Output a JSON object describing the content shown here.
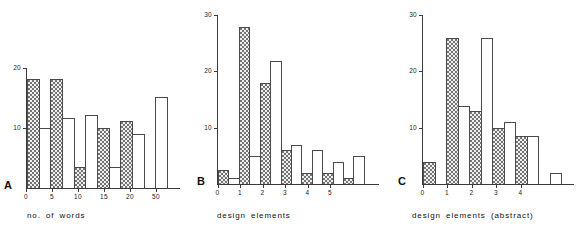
{
  "figure": {
    "background": "#ffffff",
    "bar_fill_color": "#efefef",
    "bar_stroke_color": "#4a4a4a",
    "axis_color": "#3b3b3b"
  },
  "panels": [
    {
      "letter": "A",
      "caption": "no. of words",
      "yticks": [
        "20",
        "10"
      ],
      "xticks": [
        "0",
        "5",
        "10",
        "15",
        "20",
        "50"
      ]
    },
    {
      "letter": "B",
      "caption": "design elements",
      "yticks": [
        "30",
        "20",
        "10"
      ],
      "xticks": [
        "0",
        "1",
        "2",
        "3",
        "4",
        "5"
      ]
    },
    {
      "letter": "C",
      "caption": "design elements (abstract)",
      "yticks": [
        "30",
        "20",
        "10"
      ],
      "xticks": [
        "0",
        "1",
        "2",
        "3",
        "4"
      ]
    }
  ],
  "chart_data": [
    {
      "type": "bar",
      "title": "A",
      "xlabel": "no. of words",
      "ylabel": "",
      "ylim": [
        0,
        21
      ],
      "ytick_values": [
        10,
        20
      ],
      "xtick_labels": [
        "0",
        "5",
        "10",
        "15",
        "20",
        "50"
      ],
      "grid": false,
      "legend": "none",
      "series": [
        {
          "name": "shaded",
          "values": [
            18,
            18,
            3.5,
            10,
            3.5,
            9,
            0
          ]
        },
        {
          "name": "open",
          "values": [
            10,
            11.5,
            12,
            3.5,
            11,
            0,
            15
          ]
        }
      ],
      "bars": [
        {
          "value": 18,
          "style": "shaded"
        },
        {
          "value": 10,
          "style": "open"
        },
        {
          "value": 18,
          "style": "shaded"
        },
        {
          "value": 11.5,
          "style": "open"
        },
        {
          "value": 3.5,
          "style": "shaded"
        },
        {
          "value": 12,
          "style": "open"
        },
        {
          "value": 10,
          "style": "shaded"
        },
        {
          "value": 3.5,
          "style": "open"
        },
        {
          "value": 11,
          "style": "shaded"
        },
        {
          "value": 9,
          "style": "open"
        },
        {
          "value": 0,
          "style": "shaded"
        },
        {
          "value": 15,
          "style": "open"
        }
      ]
    },
    {
      "type": "bar",
      "title": "B",
      "xlabel": "design elements",
      "ylabel": "",
      "ylim": [
        0,
        31
      ],
      "ytick_values": [
        10,
        20,
        30
      ],
      "xtick_labels": [
        "0",
        "1",
        "2",
        "3",
        "4",
        "5"
      ],
      "grid": false,
      "legend": "none",
      "series": [
        {
          "name": "shaded",
          "values": [
            2.5,
            28,
            18,
            6,
            2,
            2,
            1
          ]
        },
        {
          "name": "open",
          "values": [
            1,
            5,
            22,
            7,
            6,
            4,
            5
          ]
        }
      ],
      "bars": [
        {
          "value": 2.5,
          "style": "shaded"
        },
        {
          "value": 1,
          "style": "open"
        },
        {
          "value": 28,
          "style": "shaded"
        },
        {
          "value": 5,
          "style": "open"
        },
        {
          "value": 18,
          "style": "shaded"
        },
        {
          "value": 22,
          "style": "open"
        },
        {
          "value": 6,
          "style": "shaded"
        },
        {
          "value": 7,
          "style": "open"
        },
        {
          "value": 2,
          "style": "shaded"
        },
        {
          "value": 6,
          "style": "open"
        },
        {
          "value": 2,
          "style": "shaded"
        },
        {
          "value": 4,
          "style": "open"
        },
        {
          "value": 1,
          "style": "shaded"
        },
        {
          "value": 5,
          "style": "open"
        }
      ]
    },
    {
      "type": "bar",
      "title": "C",
      "xlabel": "design elements (abstract)",
      "ylabel": "",
      "ylim": [
        0,
        31
      ],
      "ytick_values": [
        10,
        20,
        30
      ],
      "xtick_labels": [
        "0",
        "1",
        "2",
        "3",
        "4"
      ],
      "grid": false,
      "legend": "none",
      "series": [
        {
          "name": "shaded",
          "values": [
            4,
            26,
            13,
            10,
            8.5,
            0
          ]
        },
        {
          "name": "open",
          "values": [
            0,
            14,
            26,
            11,
            8.5,
            2
          ]
        }
      ],
      "bars": [
        {
          "value": 4,
          "style": "shaded"
        },
        {
          "value": 0,
          "style": "open"
        },
        {
          "value": 26,
          "style": "shaded"
        },
        {
          "value": 14,
          "style": "open"
        },
        {
          "value": 13,
          "style": "shaded"
        },
        {
          "value": 26,
          "style": "open"
        },
        {
          "value": 10,
          "style": "shaded"
        },
        {
          "value": 11,
          "style": "open"
        },
        {
          "value": 8.5,
          "style": "shaded"
        },
        {
          "value": 8.5,
          "style": "open"
        },
        {
          "value": 0,
          "style": "shaded"
        },
        {
          "value": 2,
          "style": "open"
        }
      ]
    }
  ]
}
